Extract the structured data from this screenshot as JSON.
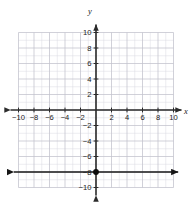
{
  "figure": {
    "kind": "coordinate-plane",
    "width": 193,
    "height": 207,
    "background": "#ffffff"
  },
  "axes": {
    "x_axis_label": "x",
    "y_axis_label": "y",
    "axis_color": "#2b2b2b",
    "grid_color": "#d8d8e0",
    "grid_major_color": "#c2c2cc",
    "origin_px": {
      "x": 96,
      "y": 110
    },
    "unit_px": 7.75,
    "xlim": [
      -10,
      10
    ],
    "ylim": [
      -10,
      10
    ],
    "grid": true,
    "tick_step": 2,
    "x_tick_labels": [
      "−10",
      "−8",
      "−6",
      "−4",
      "−2",
      "2",
      "4",
      "6",
      "8",
      "10"
    ],
    "x_tick_values": [
      -10,
      -8,
      -6,
      -4,
      -2,
      2,
      4,
      6,
      8,
      10
    ],
    "y_tick_labels": [
      "10",
      "8",
      "6",
      "4",
      "2",
      "−2",
      "−4",
      "−6",
      "−8",
      "−10"
    ],
    "y_tick_values": [
      10,
      8,
      6,
      4,
      2,
      -2,
      -4,
      -6,
      -8,
      -10
    ],
    "arrowheads": [
      "left",
      "right",
      "up",
      "down"
    ]
  },
  "chart_data": {
    "type": "line",
    "title": "",
    "xlabel": "x",
    "ylabel": "y",
    "xlim": [
      -10,
      10
    ],
    "ylim": [
      -10,
      10
    ],
    "grid": true,
    "legend": "none",
    "series": [
      {
        "name": "y = -8",
        "kind": "horizontal-line",
        "equation": "y = -8",
        "y_value": -8,
        "color": "#1a1a1a",
        "extends_both_directions": true,
        "x_start": -10.6,
        "x_end": 10.6,
        "x": [
          -10.6,
          10.6
        ],
        "values": [
          -8,
          -8
        ]
      },
      {
        "name": "plotted point",
        "kind": "point",
        "color": "#0d0d0d",
        "points": [
          {
            "x": 0,
            "y": -8
          }
        ]
      }
    ]
  }
}
